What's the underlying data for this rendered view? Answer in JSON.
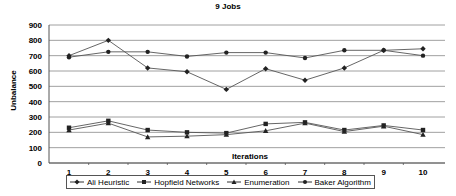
{
  "chart_data": {
    "type": "line",
    "title": "9 Jobs",
    "xlabel": "Iterations",
    "ylabel": "Unbalance",
    "x": [
      1,
      2,
      3,
      4,
      5,
      6,
      7,
      8,
      9,
      10
    ],
    "yticks": [
      0,
      100,
      200,
      300,
      400,
      500,
      600,
      700,
      800,
      900
    ],
    "ylim": [
      0,
      900
    ],
    "grid": "horizontal",
    "legend_position": "bottom",
    "series": [
      {
        "name": "Ali Heuristic",
        "marker": "diamond",
        "values": [
          700,
          800,
          620,
          595,
          480,
          615,
          540,
          620,
          735,
          745
        ]
      },
      {
        "name": "Hopfield Networks",
        "marker": "square",
        "values": [
          230,
          275,
          215,
          200,
          195,
          255,
          265,
          215,
          245,
          215
        ]
      },
      {
        "name": "Enumeration",
        "marker": "triangle",
        "values": [
          215,
          260,
          170,
          175,
          185,
          210,
          260,
          205,
          240,
          185
        ]
      },
      {
        "name": "Baker Algorithm",
        "marker": "circle",
        "values": [
          690,
          725,
          725,
          695,
          720,
          720,
          685,
          735,
          735,
          700
        ]
      }
    ]
  }
}
